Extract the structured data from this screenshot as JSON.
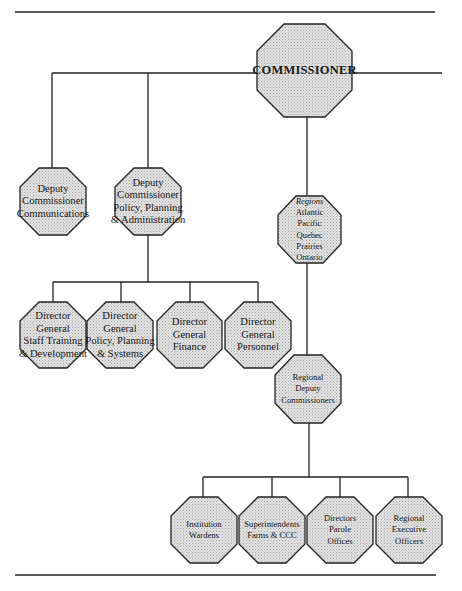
{
  "colors": {
    "line": "#222222",
    "fill": "#d9d9d9",
    "text": "#1a1a1a"
  },
  "chart": {
    "commissioner": {
      "lines": [
        "COMMISSIONER"
      ]
    },
    "deputy_communications": {
      "lines": [
        "Deputy",
        "Commissioner",
        "Communications"
      ]
    },
    "deputy_policy": {
      "lines": [
        "Deputy",
        "Commissioner",
        "Policy, Planning",
        "& Administration"
      ]
    },
    "regions": {
      "title": "Regions",
      "lines": [
        "Atlantic",
        "Pacific",
        "Quebec",
        "Prairies",
        "Ontario"
      ]
    },
    "dg_staff": {
      "lines": [
        "Director",
        "General",
        "Staff Training",
        "& Development"
      ]
    },
    "dg_policy": {
      "lines": [
        "Director",
        "General",
        "Policy, Planning",
        "& Systems"
      ]
    },
    "dg_finance": {
      "lines": [
        "Director",
        "General",
        "Finance"
      ]
    },
    "dg_personnel": {
      "lines": [
        "Director",
        "General",
        "Personnel"
      ]
    },
    "regional_deputy": {
      "lines": [
        "Regional",
        "Deputy",
        "Commissioners"
      ]
    },
    "wardens": {
      "lines": [
        "Institution",
        "Wardens"
      ]
    },
    "superintendents": {
      "lines": [
        "Superintendents",
        "Farms & CCC"
      ]
    },
    "parole": {
      "lines": [
        "Directors",
        "Parole",
        "Offices"
      ]
    },
    "executive": {
      "lines": [
        "Regional",
        "Executive",
        "Officers"
      ]
    }
  }
}
